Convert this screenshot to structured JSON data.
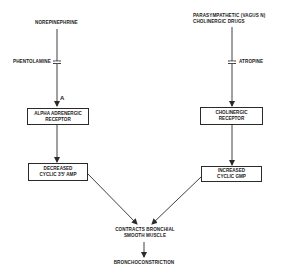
{
  "diagram": {
    "left_pathway": {
      "agonist": "NOREPINEPHRINE",
      "blocker": "PHENTOLAMINE",
      "receptor_symbol": "α",
      "receptor_box": [
        "ALPHA ADRENERGIC",
        "RECEPTOR"
      ],
      "effect_box": [
        "DECREASED",
        "CYCLIC 3'5' AMP"
      ]
    },
    "right_pathway": {
      "agonist": [
        "PARASYMPATHETIC (VAGUS N)",
        "CHOLINERGIC  DRUGS"
      ],
      "blocker": "ATROPINE",
      "receptor_box": [
        "CHOLINERGIC",
        "RECEPTOR"
      ],
      "effect_box": [
        "INCREASED",
        "CYCLIC GMP"
      ]
    },
    "convergence": [
      "CONTRACTS BRONCHIAL",
      "SMOOTH MUSCLE"
    ],
    "outcome": "BRONCHOCONSTRICTION",
    "colors": {
      "ink": "#2a2a2a",
      "background": "#ffffff"
    }
  }
}
